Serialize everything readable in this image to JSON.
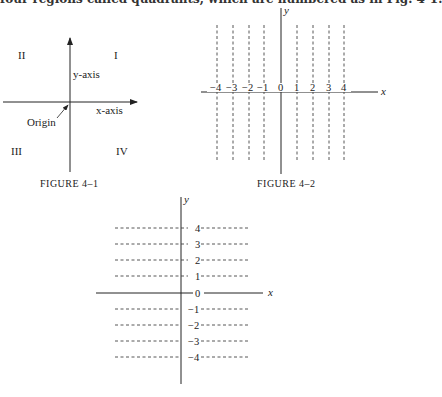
{
  "page": {
    "top_text": "four regions called quadrants, which are numbered as in Fig. 4-1."
  },
  "figure1": {
    "caption": "Figure 4–1",
    "quadrants": [
      "I",
      "II",
      "III",
      "IV"
    ],
    "y_axis_label": "y-axis",
    "x_axis_label": "x-axis",
    "origin_label": "Origin"
  },
  "figure2": {
    "caption": "Figure 4–2",
    "x_label": "x",
    "y_label": "y",
    "ticks": [
      "−4",
      "−3",
      "−2",
      "−1",
      "0",
      "1",
      "2",
      "3",
      "4"
    ]
  },
  "figure3": {
    "caption": "Figure 4–3",
    "x_label": "x",
    "y_label": "y",
    "ticks": [
      "4",
      "3",
      "2",
      "1",
      "0",
      "−1",
      "−2",
      "−3",
      "−4"
    ]
  },
  "colors": {
    "ink": "#222222",
    "background": "#ffffff"
  }
}
